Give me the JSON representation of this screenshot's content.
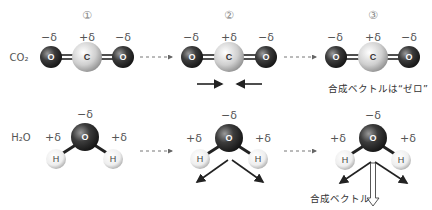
{
  "colors": {
    "oxygen": "#3a3a3a",
    "carbon": "#d8d8d8",
    "hydrogen": "#f2f2f2",
    "arrow": "#222222"
  },
  "steps": [
    "①",
    "②",
    "③"
  ],
  "rows": {
    "co2": {
      "label": "CO₂",
      "charges": {
        "o_left": "−δ",
        "c": "+δ",
        "o_right": "−δ"
      },
      "atoms": {
        "o": "O",
        "c": "C"
      },
      "result_note": "合成ベクトルは“ゼロ”"
    },
    "h2o": {
      "label": "H₂O",
      "charges": {
        "o": "−δ",
        "h_left": "+δ",
        "h_right": "+δ"
      },
      "atoms": {
        "o": "O",
        "h": "H"
      },
      "result_note": "合成ベクトル"
    }
  }
}
